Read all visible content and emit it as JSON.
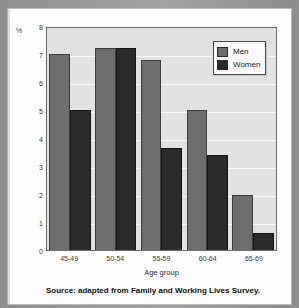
{
  "chart_data": {
    "type": "bar",
    "title": "",
    "subtitle": "",
    "xlabel": "Age group",
    "ylabel": "%",
    "y_unit_label": "%",
    "ylim": [
      0,
      8
    ],
    "ytick_labels": [
      "8",
      "7",
      "6",
      "5",
      "4",
      "3",
      "2",
      "1",
      "0"
    ],
    "yticks": [
      8,
      7,
      6,
      5,
      4,
      3,
      2,
      1,
      0
    ],
    "grid": true,
    "grid_axis": "y",
    "legend_position": "top-right",
    "categories": [
      "45-49",
      "50-54",
      "55-59",
      "60-64",
      "65-69"
    ],
    "series": [
      {
        "name": "Men",
        "color": "#6e6e6e",
        "values": [
          7.0,
          7.2,
          6.8,
          5.0,
          1.95
        ]
      },
      {
        "name": "Women",
        "color": "#2b2b2b",
        "values": [
          5.0,
          7.2,
          3.65,
          3.4,
          0.6
        ]
      }
    ],
    "annotations": []
  },
  "legend": {
    "items": [
      {
        "label": "Men",
        "color": "#6e6e6e"
      },
      {
        "label": "Women",
        "color": "#2b2b2b"
      }
    ]
  },
  "caption": {
    "source": "Source: adapted from Family and Working Lives Survey."
  },
  "colors": {
    "plot_background": "#e2e2e2",
    "gridline": "#fafafa",
    "axis": "#6b6b6b",
    "page": "#fdfdfd",
    "men": "#6e6e6e",
    "women": "#2b2b2b"
  }
}
